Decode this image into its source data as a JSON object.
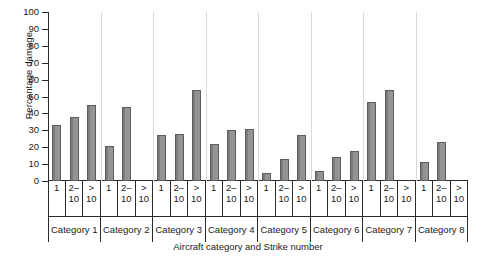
{
  "chart_data": {
    "type": "bar",
    "title": "",
    "xlabel": "Aircraft category and Strike number",
    "ylabel": "Percentage damage",
    "ylim": [
      0,
      100
    ],
    "yticks": [
      0,
      10,
      20,
      30,
      40,
      50,
      60,
      70,
      80,
      90,
      100
    ],
    "grid": false,
    "legend": "none",
    "bar_color": "#8f8f8f",
    "bar_edge_color": "#5c5c5c",
    "group_labels": [
      "Category 1",
      "Category 2",
      "Category 3",
      "Category 4",
      "Category 5",
      "Category 6",
      "Category 7",
      "Category 8"
    ],
    "subgroup_labels": [
      "1",
      "2–\n10",
      ">\n10"
    ],
    "subgroup_labels_flat": [
      "1",
      "2–10",
      "> 10"
    ],
    "categories": [
      "Category 1 / 1",
      "Category 1 / 2–10",
      "Category 1 / > 10",
      "Category 2 / 1",
      "Category 2 / 2–10",
      "Category 2 / > 10",
      "Category 3 / 1",
      "Category 3 / 2–10",
      "Category 3 / > 10",
      "Category 4 / 1",
      "Category 4 / 2–10",
      "Category 4 / > 10",
      "Category 5 / 1",
      "Category 5 / 2–10",
      "Category 5 / > 10",
      "Category 6 / 1",
      "Category 6 / 2–10",
      "Category 6 / > 10",
      "Category 7 / 1",
      "Category 7 / 2–10",
      "Category 7 / > 10",
      "Category 8 / 1",
      "Category 8 / 2–10",
      "Category 8 / > 10"
    ],
    "values": [
      33,
      38,
      45,
      21,
      44,
      0,
      27,
      28,
      54,
      22,
      30,
      31,
      5,
      13,
      27,
      6,
      14,
      18,
      47,
      54,
      0,
      11,
      23,
      0
    ],
    "groups": [
      {
        "label": "Category 1",
        "bars": [
          {
            "strike": "1",
            "value": 33
          },
          {
            "strike": "2–10",
            "value": 38
          },
          {
            "strike": "> 10",
            "value": 45
          }
        ]
      },
      {
        "label": "Category 2",
        "bars": [
          {
            "strike": "1",
            "value": 21
          },
          {
            "strike": "2–10",
            "value": 44
          },
          {
            "strike": "> 10",
            "value": 0
          }
        ]
      },
      {
        "label": "Category 3",
        "bars": [
          {
            "strike": "1",
            "value": 27
          },
          {
            "strike": "2–10",
            "value": 28
          },
          {
            "strike": "> 10",
            "value": 54
          }
        ]
      },
      {
        "label": "Category 4",
        "bars": [
          {
            "strike": "1",
            "value": 22
          },
          {
            "strike": "2–10",
            "value": 30
          },
          {
            "strike": "> 10",
            "value": 31
          }
        ]
      },
      {
        "label": "Category 5",
        "bars": [
          {
            "strike": "1",
            "value": 5
          },
          {
            "strike": "2–10",
            "value": 13
          },
          {
            "strike": "> 10",
            "value": 27
          }
        ]
      },
      {
        "label": "Category 6",
        "bars": [
          {
            "strike": "1",
            "value": 6
          },
          {
            "strike": "2–10",
            "value": 14
          },
          {
            "strike": "> 10",
            "value": 18
          }
        ]
      },
      {
        "label": "Category 7",
        "bars": [
          {
            "strike": "1",
            "value": 47
          },
          {
            "strike": "2–10",
            "value": 54
          },
          {
            "strike": "> 10",
            "value": 0
          }
        ]
      },
      {
        "label": "Category 8",
        "bars": [
          {
            "strike": "1",
            "value": 11
          },
          {
            "strike": "2–10",
            "value": 23
          },
          {
            "strike": "> 10",
            "value": 0
          }
        ]
      }
    ]
  }
}
